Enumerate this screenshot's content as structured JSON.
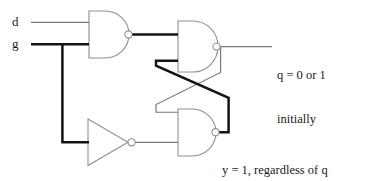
{
  "diagram": {
    "colors": {
      "ink": "#1a1a1a",
      "thin_wire": "#6e6e6e",
      "gate_outline": "#8a8a8a",
      "bold_wire": "#111111",
      "background": "#ffffff"
    },
    "inputs": [
      {
        "id": "d",
        "label": "d",
        "signal_state": "thin"
      },
      {
        "id": "g",
        "label": "g",
        "signal_state": "bold"
      }
    ],
    "gates": [
      {
        "id": "nand-top-left",
        "type": "nand",
        "inputs": [
          "d",
          "g"
        ],
        "output": "n1"
      },
      {
        "id": "nand-top-right",
        "type": "nand",
        "inputs": [
          "n1",
          "y"
        ],
        "output": "q"
      },
      {
        "id": "nand-bottom-right",
        "type": "nand",
        "inputs": [
          "q",
          "g-prime"
        ],
        "output": "y"
      },
      {
        "id": "inverter",
        "type": "not",
        "inputs": [
          "g"
        ],
        "output": "g-prime"
      }
    ],
    "annotations": {
      "q_note_line1": "q = 0 or 1",
      "q_note_line2": "initially",
      "y_note_line1": "y = 1, regardless of q",
      "y_note_line2": "(because g' = 0)"
    }
  }
}
